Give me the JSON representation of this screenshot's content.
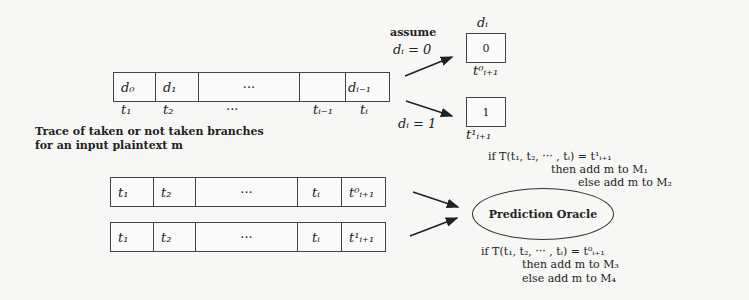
{
  "top_trace": {
    "cells": [
      "d₀",
      "d₁",
      "···",
      "",
      "dᵢ₋₁"
    ],
    "below_labels": [
      "t₁",
      "t₂",
      "···",
      "tᵢ₋₁",
      "tᵢ"
    ],
    "caption_line1": "Trace of taken or not taken branches",
    "caption_line2": "for an input plaintext m"
  },
  "assume": {
    "word": "assume",
    "case0": "dᵢ = 0",
    "case1": "dᵢ = 1",
    "box_top_label": "dᵢ",
    "box0_value": "0",
    "box0_label": "t⁰ᵢ₊₁",
    "box1_value": "1",
    "box1_label": "t¹ᵢ₊₁"
  },
  "rule1": {
    "line1": "if T(t₁, t₂, ··· , tᵢ) = t¹ᵢ₊₁",
    "line2": "then add m to M₁",
    "line3": "else add m to M₂"
  },
  "oracle": {
    "label": "Prediction Oracle"
  },
  "rule2": {
    "line1": "if T(t₁, t₂, ··· , tᵢ) = t⁰ᵢ₊₁",
    "line2": "then add m to M₃",
    "line3": "else add m to M₄"
  },
  "trace0": {
    "cells": [
      "t₁",
      "t₂",
      "···",
      "tᵢ",
      "t⁰ᵢ₊₁"
    ]
  },
  "trace1": {
    "cells": [
      "t₁",
      "t₂",
      "···",
      "tᵢ",
      "t¹ᵢ₊₁"
    ]
  }
}
